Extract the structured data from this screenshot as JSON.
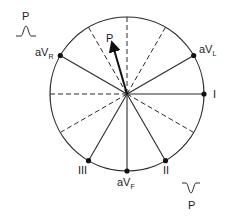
{
  "diagram": {
    "center": [
      127,
      94
    ],
    "radius": 77,
    "colors": {
      "line": "#2a2a2a",
      "background": "#ffffff"
    },
    "leads": [
      {
        "name": "I",
        "angle_deg": 0,
        "label_main": "I",
        "label_sub": "",
        "style": "solid",
        "dot": true
      },
      {
        "name": "aVL",
        "angle_deg": -30,
        "label_main": "aV",
        "label_sub": "L",
        "style": "solid",
        "dot": true
      },
      {
        "name": "aVR",
        "angle_deg": -150,
        "label_main": "aV",
        "label_sub": "R",
        "style": "solid",
        "dot": true
      },
      {
        "name": "aVF",
        "angle_deg": 90,
        "label_main": "aV",
        "label_sub": "F",
        "style": "solid",
        "dot": true
      },
      {
        "name": "II",
        "angle_deg": 60,
        "label_main": "II",
        "label_sub": "",
        "style": "solid",
        "dot": true
      },
      {
        "name": "III",
        "angle_deg": 120,
        "label_main": "III",
        "label_sub": "",
        "style": "solid",
        "dot": true
      }
    ],
    "negative_axes_dashed": [
      180,
      -90,
      -120,
      -60,
      150,
      30
    ],
    "p_axis": {
      "label": "P",
      "angle_deg": -75
    },
    "wave_insets": [
      {
        "label": "P",
        "shape": "upright",
        "position": "top-left"
      },
      {
        "label": "P",
        "shape": "inverted",
        "position": "bottom-right"
      }
    ]
  }
}
